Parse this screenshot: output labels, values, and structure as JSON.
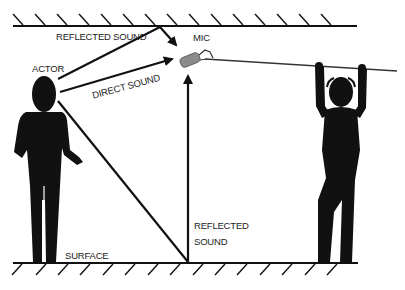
{
  "diagram": {
    "labels": {
      "reflected_sound_top": "REFLECTED SOUND",
      "mic": "MIC",
      "actor": "ACTOR",
      "direct_sound": "DIRECT SOUND",
      "reflected_sound_floor_line1": "REFLECTED",
      "reflected_sound_floor_line2": "SOUND",
      "surface": "SURFACE"
    },
    "elements": {
      "ceiling": "ceiling-surface",
      "floor": "floor-surface",
      "actor": "actor-figure",
      "boom_operator": "boom-operator-figure",
      "microphone": "boom-microphone",
      "boom_pole": "boom-pole"
    },
    "colors": {
      "ink": "#111111",
      "mic_body": "#8a8a8a",
      "background": "#ffffff"
    }
  }
}
